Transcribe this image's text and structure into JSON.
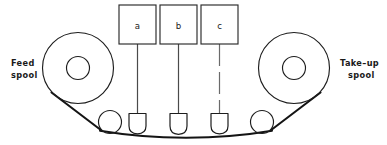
{
  "diagram": {
    "canvas": {
      "width": 387,
      "height": 145,
      "background": "#ffffff"
    },
    "colors": {
      "line": "#1d1d1d",
      "tape": "#141414",
      "stem": "#4a4a4a",
      "stem_dashed": "#6a6a6a",
      "box_fill": "#ffffff",
      "text": "#1a1a1a"
    },
    "labels": {
      "feed_spool_line1": "Feed",
      "feed_spool_line2": "spool",
      "takeup_spool_line1": "Take–up",
      "takeup_spool_line2": "spool"
    },
    "heads": [
      {
        "id": "a",
        "label": "a",
        "box_x": 119,
        "box_y": 5,
        "box_w": 37,
        "box_h": 39,
        "stem_x": 137.5,
        "stem_style": "solid",
        "probe_x": 137.5
      },
      {
        "id": "b",
        "label": "b",
        "box_x": 160,
        "box_y": 5,
        "box_w": 37,
        "box_h": 39,
        "stem_x": 178.5,
        "stem_style": "solid",
        "probe_x": 178.5
      },
      {
        "id": "c",
        "label": "c",
        "box_x": 201,
        "box_y": 5,
        "box_w": 37,
        "box_h": 39,
        "stem_x": 219.5,
        "stem_style": "dashed",
        "probe_x": 219.5
      }
    ],
    "spools": [
      {
        "id": "feed",
        "cx": 78,
        "cy": 68,
        "r_outer": 35.5,
        "r_hub": 11.5
      },
      {
        "id": "takeup",
        "cx": 294,
        "cy": 68,
        "r_outer": 35.5,
        "r_hub": 11.5
      }
    ],
    "rollers": [
      {
        "id": "left-guide-roller",
        "cx": 110,
        "cy": 122,
        "r": 11.5
      },
      {
        "id": "right-guide-roller",
        "cx": 262,
        "cy": 122,
        "r": 11.5
      }
    ],
    "probe": {
      "width": 17,
      "top_y": 113,
      "body_h": 13,
      "tip_h": 8
    },
    "tape_path": {
      "description": "tape runs from feed spool over left roller, across three heads, over right roller, onto take-up spool",
      "points": "M 59 96 L 100 128 L 135 134 L 185 136 L 240 134 L 272 128 L 312 96"
    }
  }
}
